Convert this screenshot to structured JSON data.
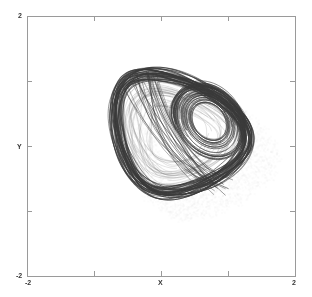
{
  "chart_data": {
    "type": "line",
    "title": "",
    "xlabel": "X",
    "ylabel": "Y",
    "xlim": [
      -2,
      2
    ],
    "ylim": [
      -2,
      2
    ],
    "x_tick_labels": [
      "-2",
      "X",
      "2"
    ],
    "y_tick_labels": [
      "2",
      "Y",
      "-2"
    ],
    "x_ticks": [
      -2,
      -1,
      0,
      1,
      2
    ],
    "y_ticks": [
      -2,
      -1,
      0,
      1,
      2
    ],
    "grid": false,
    "legend": null,
    "series": [
      {
        "name": "trajectory",
        "color": "#3a3a3a",
        "approx_extent": {
          "x_min": -1.0,
          "x_max": 1.4,
          "y_min": -1.0,
          "y_max": 1.3
        },
        "inner_loop_center": [
          0.75,
          0.35
        ]
      },
      {
        "name": "shadow",
        "color": "#d0d0d0"
      }
    ]
  },
  "axes": {
    "frame_color": "#9a9a9a",
    "label_color": "#333333"
  }
}
